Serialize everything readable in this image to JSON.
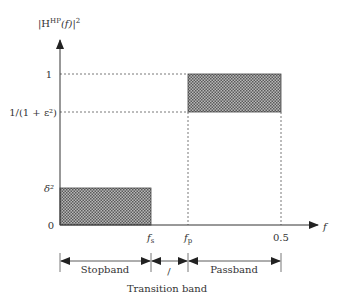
{
  "diagram": {
    "y_axis_label": "|H^HP(f)|^2",
    "y_axis_label_parts": {
      "base": "|H",
      "sup": "HP",
      "mid": "(f)|",
      "sup2": "2"
    },
    "x_axis_label": "f",
    "y_ticks": [
      {
        "label": "1",
        "value": 1
      },
      {
        "label": "1/(1 + ε²)",
        "value": "1/(1+eps^2)"
      },
      {
        "label": "δ²",
        "value": "delta^2"
      },
      {
        "label": "0",
        "value": 0
      }
    ],
    "x_ticks": [
      {
        "label_main": "f",
        "label_sub": "s",
        "name": "stopband-edge"
      },
      {
        "label_main": "f",
        "label_sub": "p",
        "name": "passband-edge"
      },
      {
        "label_main": "0.5",
        "label_sub": "",
        "name": "nyquist"
      }
    ],
    "bands": [
      {
        "label": "Stopband"
      },
      {
        "label": "/"
      },
      {
        "label": "Passband"
      }
    ],
    "transition_label": "Transition band",
    "colors": {
      "axis": "#333333",
      "fill": "#8a8a8a",
      "dotted": "#555555"
    }
  }
}
